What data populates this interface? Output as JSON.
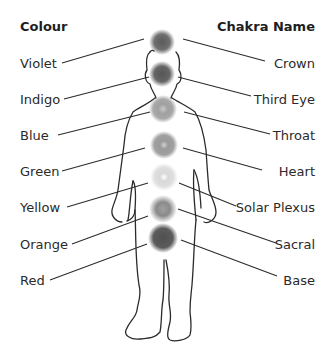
{
  "headers": {
    "colour": "Colour",
    "chakra_name": "Chakra Name"
  },
  "rows": [
    {
      "colour": "Violet",
      "chakra": "Crown",
      "shade": "#6f6f6f"
    },
    {
      "colour": "Indigo",
      "chakra": "Third Eye",
      "shade": "#656565"
    },
    {
      "colour": "Blue",
      "chakra": "Throat",
      "shade": "#a8a8a8"
    },
    {
      "colour": "Green",
      "chakra": "Heart",
      "shade": "#9c9c9c"
    },
    {
      "colour": "Yellow",
      "chakra": "Solar Plexus",
      "shade": "#d6d6d6"
    },
    {
      "colour": "Orange",
      "chakra": "Sacral",
      "shade": "#8c8c8c"
    },
    {
      "colour": "Red",
      "chakra": "Base",
      "shade": "#5e5e5e"
    }
  ]
}
